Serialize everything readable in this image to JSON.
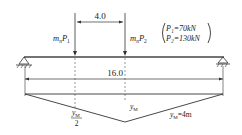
{
  "diagram": {
    "spacing_label": "4.0",
    "span_label": "16.0",
    "load1": {
      "coef": "m",
      "sub": "n",
      "P": "P",
      "idx": "1"
    },
    "load2": {
      "coef": "m",
      "sub": "n",
      "P": "P",
      "idx": "2"
    },
    "legend": {
      "p1": "P₁=70kN",
      "p2": "P₂=130kN"
    },
    "influence": {
      "ym_label": "y",
      "ym_sub": "M",
      "half_num": "y",
      "half_sub": "M",
      "half_den": "2",
      "ym_value": "=4m"
    }
  },
  "colors": {
    "line": "#222222",
    "background": "#ffffff"
  }
}
